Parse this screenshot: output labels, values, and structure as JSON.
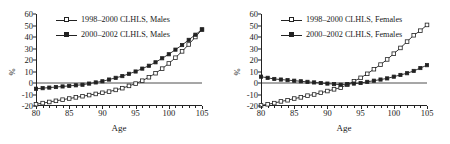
{
  "figure": {
    "panels": [
      {
        "id": "males",
        "legend": [
          {
            "label": "1998–2000 CLHLS, Males",
            "marker": "open-square"
          },
          {
            "label": "2000–2002 CLHLS, Males",
            "marker": "filled-square"
          }
        ]
      },
      {
        "id": "females",
        "legend": [
          {
            "label": "1998–2000 CLHLS, Females",
            "marker": "open-square"
          },
          {
            "label": "2000–2002 CLHLS, Females",
            "marker": "filled-square"
          }
        ]
      }
    ]
  },
  "chart_data": [
    {
      "type": "line",
      "panel": "left",
      "title": "",
      "xlabel": "Age",
      "ylabel": "%",
      "xlim": [
        80,
        105
      ],
      "ylim": [
        -20,
        60
      ],
      "xticks": [
        80,
        85,
        90,
        95,
        100,
        105
      ],
      "yticks": [
        -20,
        -10,
        0,
        10,
        20,
        30,
        40,
        50,
        60
      ],
      "grid": false,
      "legend_position": "top-left",
      "x": [
        80,
        81,
        82,
        83,
        84,
        85,
        86,
        87,
        88,
        89,
        90,
        91,
        92,
        93,
        94,
        95,
        96,
        97,
        98,
        99,
        100,
        101,
        102,
        103,
        104,
        105
      ],
      "series": [
        {
          "name": "1998–2000 CLHLS, Males",
          "marker": "open-square",
          "values": [
            -18.5,
            -17.5,
            -16.5,
            -15.5,
            -14.5,
            -13.5,
            -12.5,
            -11.5,
            -10.5,
            -9.5,
            -8.5,
            -7.5,
            -6.0,
            -4.5,
            -2.5,
            -0.5,
            2.0,
            5.0,
            8.5,
            12.5,
            17.0,
            22.0,
            27.5,
            33.5,
            40.0,
            46.5
          ]
        },
        {
          "name": "2000–2002 CLHLS, Males",
          "marker": "filled-square",
          "values": [
            -5.0,
            -4.5,
            -4.0,
            -3.5,
            -3.0,
            -2.5,
            -2.0,
            -1.5,
            -0.5,
            0.5,
            1.5,
            3.0,
            4.5,
            6.0,
            8.0,
            10.0,
            12.5,
            15.0,
            18.0,
            21.5,
            25.0,
            29.0,
            33.0,
            37.5,
            42.0,
            46.5
          ]
        }
      ]
    },
    {
      "type": "line",
      "panel": "right",
      "title": "",
      "xlabel": "Age",
      "ylabel": "%",
      "xlim": [
        80,
        105
      ],
      "ylim": [
        -20,
        60
      ],
      "xticks": [
        80,
        85,
        90,
        95,
        100,
        105
      ],
      "yticks": [
        -20,
        -10,
        0,
        10,
        20,
        30,
        40,
        50,
        60
      ],
      "grid": false,
      "legend_position": "top-left",
      "x": [
        80,
        81,
        82,
        83,
        84,
        85,
        86,
        87,
        88,
        89,
        90,
        91,
        92,
        93,
        94,
        95,
        96,
        97,
        98,
        99,
        100,
        101,
        102,
        103,
        104,
        105
      ],
      "series": [
        {
          "name": "1998–2000 CLHLS, Females",
          "marker": "open-square",
          "values": [
            -19.5,
            -18.5,
            -17.5,
            -16.0,
            -15.0,
            -13.5,
            -12.5,
            -11.0,
            -10.0,
            -8.5,
            -7.0,
            -5.5,
            -4.0,
            -1.5,
            1.5,
            4.5,
            8.0,
            12.0,
            16.0,
            20.5,
            25.5,
            30.5,
            36.0,
            41.5,
            45.5,
            50.5
          ]
        },
        {
          "name": "2000–2002 CLHLS, Females",
          "marker": "filled-square",
          "values": [
            5.5,
            4.5,
            3.5,
            3.0,
            2.5,
            2.0,
            1.5,
            1.0,
            0.5,
            0.0,
            -0.5,
            -1.0,
            -1.5,
            -1.0,
            -0.5,
            0.0,
            1.0,
            2.0,
            3.0,
            4.0,
            5.5,
            7.0,
            8.5,
            10.5,
            13.0,
            15.5
          ]
        }
      ]
    }
  ]
}
